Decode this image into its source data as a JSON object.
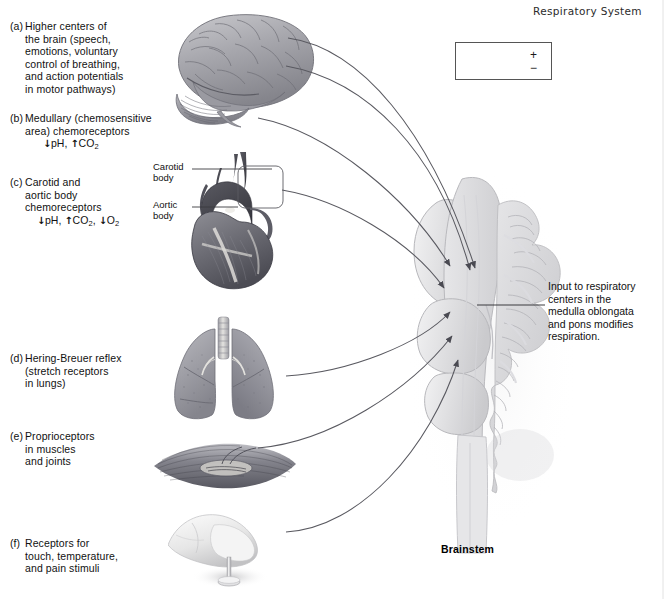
{
  "figure": {
    "title": "Respiratory System",
    "brainstem_label": "Brainstem"
  },
  "legend": {
    "name": "arrow-legend",
    "items": [
      {
        "symbol": "+",
        "meaning": "stimulatory input"
      },
      {
        "symbol": "−",
        "meaning": "inhibitory input"
      }
    ]
  },
  "inputs": [
    {
      "tag": "(a)",
      "line1": "Higher centers of",
      "line2": "the brain (speech,",
      "line3": "emotions, voluntary",
      "line4": "control of breathing,",
      "line5": "and action potentials",
      "line6": "in motor pathways)",
      "icon": "brain-illustration"
    },
    {
      "tag": "(b)",
      "line1": "Medullary (chemosensitive",
      "line2": "area) chemoreceptors",
      "chem_down1": "↓",
      "chem_ph": "pH,",
      "chem_up1": "↑",
      "chem_co2": "CO",
      "chem_co2_sub": "2",
      "icon": "none"
    },
    {
      "tag": "(c)",
      "line1": "Carotid and",
      "line2": "aortic body",
      "line3": "chemoreceptors",
      "chem_down1": "↓",
      "chem_ph": "pH,",
      "chem_up1": "↑",
      "chem_co2": "CO",
      "chem_co2_sub": "2",
      "chem_comma": ",",
      "chem_down2": "↓",
      "chem_o2": "O",
      "chem_o2_sub": "2",
      "icon": "heart-illustration"
    },
    {
      "tag": "(d)",
      "line1": "Hering-Breuer reflex",
      "line2": "(stretch receptors",
      "line3": "in lungs)",
      "icon": "lungs-illustration"
    },
    {
      "tag": "(e)",
      "line1": "Proprioceptors",
      "line2": "in muscles",
      "line3": "and joints",
      "icon": "muscle-spindle-illustration"
    },
    {
      "tag": "(f)",
      "line1": "Receptors for",
      "line2": "touch, temperature,",
      "line3": "and pain stimuli",
      "icon": "hand-pin-illustration"
    }
  ],
  "callouts": {
    "carotid_body_line1": "Carotid",
    "carotid_body_line2": "body",
    "aortic_body_line1": "Aortic",
    "aortic_body_line2": "body",
    "output_line1": "Input to respiratory",
    "output_line2": "centers in the",
    "output_line3": "medulla oblongata",
    "output_line4": "and pons modifies",
    "output_line5": "respiration."
  },
  "colors": {
    "ink": "#1a1a1a",
    "arrow": "#4a4a52",
    "rule": "#555555",
    "brainstem_light": "#e9e9ea",
    "brainstem_mid": "#d3d3d6",
    "brainstem_dark": "#bdbdc2",
    "organ_dark": "#6d6d72",
    "organ_mid": "#97979c"
  }
}
